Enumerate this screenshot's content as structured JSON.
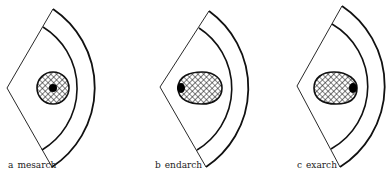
{
  "figure": {
    "panels": [
      {
        "letter": "a",
        "name": "mesarch",
        "protoxylem_position": "center",
        "xylem_shape": "circle"
      },
      {
        "letter": "b",
        "name": "endarch",
        "protoxylem_position": "inner",
        "xylem_shape": "ovoid"
      },
      {
        "letter": "c",
        "name": "exarch",
        "protoxylem_position": "outer",
        "xylem_shape": "ovoid"
      }
    ],
    "colors": {
      "stroke": "#111111",
      "background": "#ffffff",
      "protoxylem": "#000000"
    }
  }
}
